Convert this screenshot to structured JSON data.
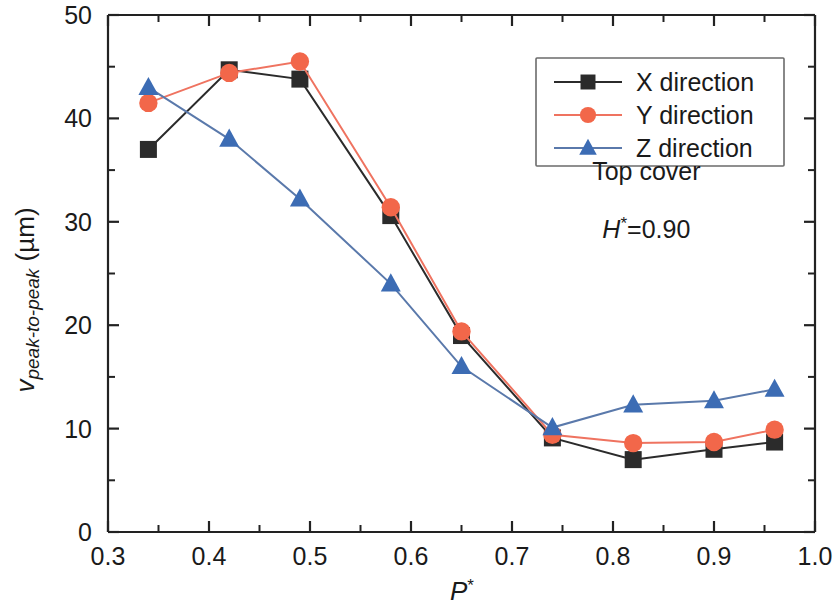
{
  "chart_data": {
    "type": "line",
    "title": "",
    "xlabel": "P*",
    "ylabel": "v_peak-to-peak (µm)",
    "xlim": [
      0.3,
      1.0
    ],
    "ylim": [
      0,
      50
    ],
    "x_ticks": [
      "0.3",
      "0.4",
      "0.5",
      "0.6",
      "0.7",
      "0.8",
      "0.9",
      "1.0"
    ],
    "x_tick_values": [
      0.3,
      0.4,
      0.5,
      0.6,
      0.7,
      0.8,
      0.9,
      1.0
    ],
    "y_ticks": [
      "0",
      "10",
      "20",
      "30",
      "40",
      "50"
    ],
    "y_tick_values": [
      0,
      10,
      20,
      30,
      40,
      50
    ],
    "x_minor_step": 0.05,
    "y_minor_step": 5,
    "grid": false,
    "legend_position": "upper right",
    "x": [
      0.34,
      0.42,
      0.49,
      0.58,
      0.65,
      0.74,
      0.82,
      0.9,
      0.96
    ],
    "series": [
      {
        "name": "X direction",
        "marker": "square",
        "color": "#2b2b2b",
        "line_color": "#2b2b2b",
        "values": [
          37.0,
          44.7,
          43.8,
          30.6,
          19.0,
          9.1,
          7.0,
          8.0,
          8.7
        ]
      },
      {
        "name": "Y direction",
        "marker": "circle",
        "color": "#f2674a",
        "line_color": "#ef7360",
        "values": [
          41.5,
          44.4,
          45.5,
          31.4,
          19.4,
          9.4,
          8.6,
          8.7,
          9.9
        ]
      },
      {
        "name": "Z direction",
        "marker": "triangle",
        "color": "#3c6cb4",
        "line_color": "#5a79ab",
        "values": [
          43.0,
          38.0,
          32.2,
          24.0,
          16.0,
          10.1,
          12.3,
          12.7,
          13.8
        ]
      }
    ],
    "annotations": [
      {
        "text": "Top cover",
        "x": 0.833,
        "y": 34.0
      },
      {
        "text": "H*=0.90",
        "x": 0.833,
        "y": 28.4
      }
    ]
  },
  "axes": {
    "y_label_main": "v",
    "y_label_sub": "peak-to-peak",
    "y_label_unit": " (µm)",
    "x_label_main": "P",
    "x_label_sup": "*"
  },
  "annotation_text": {
    "top_cover": "Top cover",
    "h_main": "H",
    "h_sup": "*",
    "h_value": "=0.90"
  },
  "legend": {
    "items": [
      {
        "label": "X direction"
      },
      {
        "label": "Y direction"
      },
      {
        "label": "Z direction"
      }
    ]
  },
  "colors": {
    "x_series": "#2b2b2b",
    "y_series": "#f2674a",
    "z_series": "#3c6cb4",
    "axis": "#222222",
    "legend_border": "#6b6b6b"
  }
}
